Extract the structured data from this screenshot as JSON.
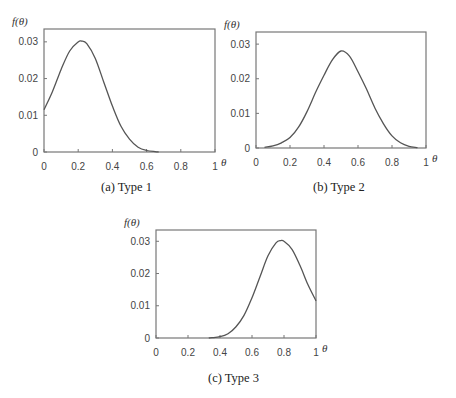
{
  "chart_data": [
    {
      "type": "line",
      "caption": "(a) Type 1",
      "xlabel": "θ",
      "ylabel": "f(θ)",
      "xticks": [
        "0",
        "0.2",
        "0.4",
        "0.6",
        "0.8",
        "1"
      ],
      "yticks": [
        "0",
        "0.01",
        "0.02",
        "0.03"
      ],
      "xlim": [
        0,
        1
      ],
      "ylim": [
        0,
        0.0335
      ],
      "grid": false,
      "x": [
        0,
        0.05,
        0.1,
        0.15,
        0.2,
        0.22,
        0.25,
        0.3,
        0.35,
        0.4,
        0.45,
        0.5,
        0.55,
        0.6,
        0.65,
        0.67
      ],
      "y": [
        0.0115,
        0.0165,
        0.0225,
        0.0275,
        0.03,
        0.0302,
        0.0295,
        0.0255,
        0.019,
        0.0125,
        0.007,
        0.0035,
        0.0013,
        0.0004,
        0.0001,
        0.0
      ]
    },
    {
      "type": "line",
      "caption": "(b) Type 2",
      "xlabel": "θ",
      "ylabel": "f(θ)",
      "xticks": [
        "0",
        "0.2",
        "0.4",
        "0.6",
        "0.8",
        "1"
      ],
      "yticks": [
        "0",
        "0.01",
        "0.02",
        "0.03"
      ],
      "xlim": [
        0,
        1
      ],
      "ylim": [
        0,
        0.0335
      ],
      "grid": false,
      "x": [
        0.05,
        0.1,
        0.15,
        0.2,
        0.25,
        0.3,
        0.35,
        0.4,
        0.45,
        0.5,
        0.55,
        0.6,
        0.65,
        0.7,
        0.75,
        0.8,
        0.85,
        0.9,
        0.95
      ],
      "y": [
        0.0002,
        0.0006,
        0.0015,
        0.003,
        0.006,
        0.0105,
        0.016,
        0.021,
        0.0255,
        0.028,
        0.0265,
        0.022,
        0.017,
        0.0115,
        0.007,
        0.0035,
        0.0015,
        0.0005,
        0.0001
      ]
    },
    {
      "type": "line",
      "caption": "(c) Type 3",
      "xlabel": "θ",
      "ylabel": "f(θ)",
      "xticks": [
        "0",
        "0.2",
        "0.4",
        "0.6",
        "0.8",
        "1"
      ],
      "yticks": [
        "0",
        "0.01",
        "0.02",
        "0.03"
      ],
      "xlim": [
        0,
        1
      ],
      "ylim": [
        0,
        0.0335
      ],
      "grid": false,
      "x": [
        0.33,
        0.35,
        0.4,
        0.45,
        0.5,
        0.55,
        0.6,
        0.65,
        0.7,
        0.75,
        0.78,
        0.8,
        0.85,
        0.9,
        0.95,
        1.0
      ],
      "y": [
        0.0,
        0.0001,
        0.0004,
        0.0013,
        0.0035,
        0.007,
        0.0125,
        0.019,
        0.0255,
        0.0295,
        0.0302,
        0.03,
        0.0275,
        0.0225,
        0.0165,
        0.0115
      ]
    }
  ],
  "captions": {
    "a": "(a) Type 1",
    "b": "(b) Type 2",
    "c": "(c) Type 3"
  },
  "style": {
    "line_color": "#555555",
    "axis_color": "#777777"
  }
}
